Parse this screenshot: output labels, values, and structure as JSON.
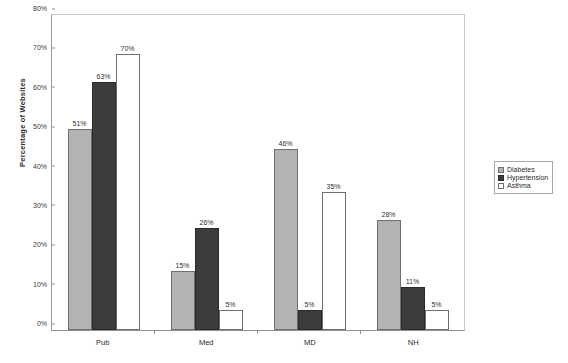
{
  "chart_data": {
    "type": "bar",
    "title": "",
    "xlabel": "",
    "ylabel": "Percentage of Websites",
    "categories": [
      "Pub",
      "Med",
      "MD",
      "NH"
    ],
    "series": [
      {
        "name": "Diabetes",
        "color": "#b3b3b3",
        "values": [
          51,
          15,
          46,
          28
        ],
        "labels": [
          "51%",
          "15%",
          "46%",
          "28%"
        ]
      },
      {
        "name": "Hypertension",
        "color": "#3c3c3c",
        "values": [
          63,
          26,
          5,
          11
        ],
        "labels": [
          "63%",
          "26%",
          "5%",
          "11%"
        ]
      },
      {
        "name": "Asthma",
        "color": "#ffffff",
        "values": [
          70,
          5,
          35,
          5
        ],
        "labels": [
          "70%",
          "5%",
          "35%",
          "5%"
        ]
      }
    ],
    "ylim": [
      0,
      80
    ],
    "y_ticks": [
      0,
      10,
      20,
      30,
      40,
      50,
      60,
      70,
      80
    ],
    "y_tick_labels": [
      "0%",
      "10%",
      "20%",
      "30%",
      "40%",
      "50%",
      "60%",
      "70%",
      "80%"
    ],
    "grid": false,
    "legend_position": "right"
  },
  "legend": {
    "items": [
      {
        "label": "Diabetes"
      },
      {
        "label": "Hypertension"
      },
      {
        "label": "Asthma"
      }
    ]
  }
}
